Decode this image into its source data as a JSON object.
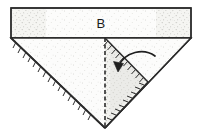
{
  "figure": {
    "kind": "origami-fold-diagram",
    "background_color": "#ffffff",
    "ink_color": "#2b2b2b",
    "paper_fill": "#fcfcfb",
    "shaded_fill": "#efefec",
    "labels": [
      {
        "id": "panel-b",
        "text": "B",
        "x": 101,
        "y": 22
      }
    ],
    "annotations": {
      "fold_arrow": {
        "name": "fold-direction-arrow",
        "description": "curved arrow indicating fold down and to the left",
        "direction": "down-left"
      },
      "center_fold": {
        "name": "center-fold-line",
        "style": "dashed",
        "orientation": "vertical"
      }
    },
    "shapes": {
      "top_band": {
        "name": "top-rectangular-band",
        "points": "11,8 191,8 191,38 11,38"
      },
      "main_triangle": {
        "name": "main-downward-triangle",
        "points": "11,38 191,38 105,128"
      },
      "right_flap": {
        "name": "right-folding-flap",
        "points": "105,38 148,82 105,128"
      }
    }
  }
}
